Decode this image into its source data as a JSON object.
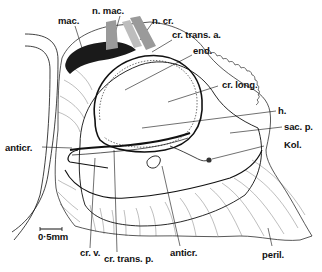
{
  "figure": {
    "type": "anatomical drawing",
    "labels": {
      "mac": "mac.",
      "n_mac": "n. mac.",
      "n_cr": "n. cr.",
      "cr_trans_a": "cr. trans. a.",
      "end": "end.",
      "cr_long": "cr. long.",
      "h": "h.",
      "sac_p": "sac. p.",
      "kol": "Kol.",
      "anticr_left": "anticr.",
      "anticr_bottom": "anticr.",
      "cr_v": "cr. v.",
      "cr_trans_p": "cr. trans. p.",
      "peril": "peril."
    },
    "scale_bar": {
      "label": "0·5mm"
    },
    "colors": {
      "ink": "#111111",
      "background": "#ffffff",
      "nerve": "#9a9a9a"
    }
  }
}
